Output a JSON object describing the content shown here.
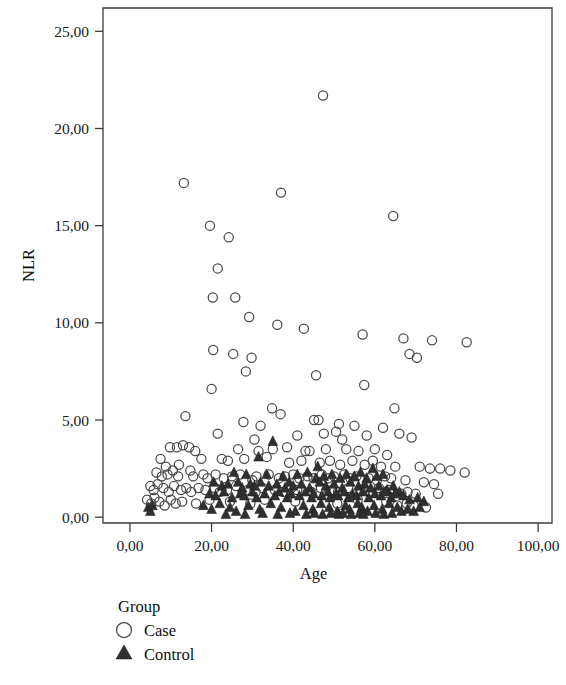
{
  "figure": {
    "background": "#ffffff",
    "plot_area": {
      "left": 103,
      "top": 8,
      "right": 552,
      "bottom": 523
    }
  },
  "axes": {
    "x": {
      "title": "Age",
      "ticks": [
        "0,00",
        "20,00",
        "40,00",
        "60,00",
        "80,00",
        "100,00"
      ],
      "tick_values": [
        0,
        20,
        40,
        60,
        80,
        100
      ],
      "min": -6.6,
      "max": 103.4
    },
    "y": {
      "title": "NLR",
      "ticks": [
        "0,00",
        "5,00",
        "10,00",
        "15,00",
        "20,00",
        "25,00"
      ],
      "tick_values": [
        0,
        5,
        10,
        15,
        20,
        25
      ],
      "min": -0.3,
      "max": 26.2
    }
  },
  "legend": {
    "title": "Group",
    "items": [
      {
        "label": "Case",
        "marker": "open-circle",
        "color": "#4a4a4a"
      },
      {
        "label": "Control",
        "marker": "filled-triangle",
        "color": "#303030"
      }
    ]
  },
  "chart_data": {
    "type": "scatter",
    "title": "",
    "xlabel": "Age",
    "ylabel": "NLR",
    "xlim": [
      -6.6,
      103.4
    ],
    "ylim": [
      -0.3,
      26.2
    ],
    "xticks": [
      0,
      20,
      40,
      60,
      80,
      100
    ],
    "yticks": [
      0,
      5,
      10,
      15,
      20,
      25
    ],
    "grid": false,
    "legend_position": "below-left",
    "series": [
      {
        "name": "Case",
        "marker": "open-circle",
        "color": "#4a4a4a",
        "points": [
          [
            47.3,
            21.7
          ],
          [
            13.2,
            17.2
          ],
          [
            37.0,
            16.7
          ],
          [
            64.5,
            15.5
          ],
          [
            19.6,
            15.0
          ],
          [
            24.2,
            14.4
          ],
          [
            21.5,
            12.8
          ],
          [
            20.3,
            11.3
          ],
          [
            25.8,
            11.3
          ],
          [
            29.2,
            10.3
          ],
          [
            36.1,
            9.9
          ],
          [
            42.6,
            9.7
          ],
          [
            57.0,
            9.4
          ],
          [
            67.0,
            9.2
          ],
          [
            74.0,
            9.1
          ],
          [
            82.5,
            9.0
          ],
          [
            20.4,
            8.6
          ],
          [
            25.3,
            8.4
          ],
          [
            29.8,
            8.2
          ],
          [
            70.3,
            8.2
          ],
          [
            68.5,
            8.4
          ],
          [
            28.4,
            7.5
          ],
          [
            45.6,
            7.3
          ],
          [
            57.4,
            6.8
          ],
          [
            20.0,
            6.6
          ],
          [
            34.8,
            5.6
          ],
          [
            36.9,
            5.3
          ],
          [
            13.6,
            5.2
          ],
          [
            64.8,
            5.6
          ],
          [
            27.8,
            4.9
          ],
          [
            32.0,
            4.7
          ],
          [
            45.1,
            5.0
          ],
          [
            46.2,
            5.0
          ],
          [
            51.2,
            4.8
          ],
          [
            55.0,
            4.7
          ],
          [
            62.0,
            4.6
          ],
          [
            21.5,
            4.3
          ],
          [
            30.5,
            4.0
          ],
          [
            41.0,
            4.2
          ],
          [
            47.5,
            4.3
          ],
          [
            50.5,
            4.4
          ],
          [
            52.0,
            4.0
          ],
          [
            58.0,
            4.2
          ],
          [
            66.0,
            4.3
          ],
          [
            69.0,
            4.1
          ],
          [
            9.8,
            3.6
          ],
          [
            11.5,
            3.6
          ],
          [
            13.0,
            3.7
          ],
          [
            14.5,
            3.6
          ],
          [
            16.0,
            3.4
          ],
          [
            26.5,
            3.5
          ],
          [
            31.5,
            3.4
          ],
          [
            35.0,
            3.5
          ],
          [
            38.5,
            3.6
          ],
          [
            43.0,
            3.4
          ],
          [
            44.0,
            3.4
          ],
          [
            48.0,
            3.5
          ],
          [
            53.0,
            3.5
          ],
          [
            56.0,
            3.4
          ],
          [
            60.0,
            3.5
          ],
          [
            63.0,
            3.2
          ],
          [
            7.5,
            3.0
          ],
          [
            8.8,
            2.6
          ],
          [
            12.0,
            2.7
          ],
          [
            17.5,
            3.0
          ],
          [
            22.5,
            3.0
          ],
          [
            24.0,
            2.9
          ],
          [
            28.0,
            3.0
          ],
          [
            33.5,
            3.1
          ],
          [
            39.0,
            2.8
          ],
          [
            42.0,
            2.9
          ],
          [
            46.5,
            2.8
          ],
          [
            49.0,
            2.9
          ],
          [
            51.5,
            2.7
          ],
          [
            54.5,
            2.9
          ],
          [
            57.5,
            2.7
          ],
          [
            59.5,
            2.9
          ],
          [
            61.5,
            2.6
          ],
          [
            65.0,
            2.6
          ],
          [
            71.0,
            2.6
          ],
          [
            73.5,
            2.5
          ],
          [
            76.0,
            2.5
          ],
          [
            78.5,
            2.4
          ],
          [
            82.0,
            2.3
          ],
          [
            6.5,
            2.3
          ],
          [
            7.8,
            2.1
          ],
          [
            9.2,
            2.2
          ],
          [
            10.5,
            2.4
          ],
          [
            11.8,
            2.1
          ],
          [
            14.8,
            2.4
          ],
          [
            15.5,
            2.1
          ],
          [
            18.0,
            2.2
          ],
          [
            19.0,
            2.0
          ],
          [
            21.0,
            2.2
          ],
          [
            23.0,
            2.0
          ],
          [
            25.0,
            2.1
          ],
          [
            27.0,
            2.2
          ],
          [
            30.0,
            1.9
          ],
          [
            31.0,
            2.1
          ],
          [
            34.0,
            2.2
          ],
          [
            36.5,
            2.0
          ],
          [
            38.0,
            2.1
          ],
          [
            40.0,
            2.2
          ],
          [
            41.5,
            2.0
          ],
          [
            43.5,
            2.1
          ],
          [
            45.0,
            2.0
          ],
          [
            47.0,
            2.2
          ],
          [
            48.5,
            2.0
          ],
          [
            50.0,
            2.1
          ],
          [
            52.5,
            2.2
          ],
          [
            54.0,
            2.0
          ],
          [
            55.5,
            2.1
          ],
          [
            58.5,
            2.0
          ],
          [
            60.5,
            1.9
          ],
          [
            62.5,
            2.1
          ],
          [
            64.0,
            2.0
          ],
          [
            67.5,
            1.9
          ],
          [
            72.0,
            1.8
          ],
          [
            74.5,
            1.7
          ],
          [
            5.0,
            1.6
          ],
          [
            5.8,
            1.4
          ],
          [
            6.8,
            1.7
          ],
          [
            8.2,
            1.5
          ],
          [
            9.5,
            1.3
          ],
          [
            10.8,
            1.6
          ],
          [
            12.5,
            1.4
          ],
          [
            13.8,
            1.5
          ],
          [
            15.0,
            1.3
          ],
          [
            16.8,
            1.5
          ],
          [
            18.5,
            1.4
          ],
          [
            20.8,
            1.5
          ],
          [
            22.0,
            1.3
          ],
          [
            23.8,
            1.4
          ],
          [
            26.0,
            1.6
          ],
          [
            28.8,
            1.4
          ],
          [
            30.8,
            1.3
          ],
          [
            32.5,
            1.5
          ],
          [
            35.5,
            1.4
          ],
          [
            37.5,
            1.3
          ],
          [
            39.5,
            1.5
          ],
          [
            41.0,
            1.4
          ],
          [
            44.5,
            1.3
          ],
          [
            46.8,
            1.5
          ],
          [
            49.5,
            1.4
          ],
          [
            51.0,
            1.3
          ],
          [
            53.5,
            1.5
          ],
          [
            56.5,
            1.4
          ],
          [
            59.0,
            1.3
          ],
          [
            61.0,
            1.5
          ],
          [
            63.5,
            1.4
          ],
          [
            66.5,
            1.2
          ],
          [
            68.0,
            1.3
          ],
          [
            70.0,
            1.2
          ],
          [
            75.5,
            1.2
          ],
          [
            4.2,
            0.9
          ],
          [
            5.2,
            0.7
          ],
          [
            6.0,
            1.0
          ],
          [
            7.2,
            0.8
          ],
          [
            8.5,
            0.6
          ],
          [
            10.0,
            0.9
          ],
          [
            11.2,
            0.7
          ],
          [
            12.8,
            0.8
          ],
          [
            16.2,
            0.7
          ],
          [
            19.5,
            0.9
          ],
          [
            24.5,
            0.8
          ],
          [
            29.5,
            0.7
          ],
          [
            33.0,
            0.9
          ],
          [
            40.5,
            0.8
          ],
          [
            50.8,
            0.7
          ],
          [
            55.8,
            0.9
          ],
          [
            62.8,
            0.8
          ],
          [
            65.5,
            0.6
          ],
          [
            67.8,
            0.7
          ],
          [
            69.5,
            0.6
          ],
          [
            72.5,
            0.5
          ]
        ]
      },
      {
        "name": "Control",
        "marker": "filled-triangle",
        "color": "#303030",
        "points": [
          [
            35.0,
            3.9
          ],
          [
            31.5,
            3.1
          ],
          [
            46.0,
            2.6
          ],
          [
            59.5,
            2.5
          ],
          [
            62.0,
            2.2
          ],
          [
            25.5,
            2.3
          ],
          [
            28.5,
            2.2
          ],
          [
            33.5,
            2.2
          ],
          [
            37.5,
            2.1
          ],
          [
            41.0,
            2.2
          ],
          [
            43.5,
            2.3
          ],
          [
            45.5,
            2.0
          ],
          [
            47.5,
            2.1
          ],
          [
            49.5,
            2.2
          ],
          [
            51.5,
            2.0
          ],
          [
            53.0,
            2.2
          ],
          [
            55.0,
            2.1
          ],
          [
            56.5,
            2.3
          ],
          [
            58.0,
            2.0
          ],
          [
            60.5,
            2.1
          ],
          [
            20.5,
            1.8
          ],
          [
            22.5,
            1.6
          ],
          [
            24.0,
            1.7
          ],
          [
            26.5,
            1.8
          ],
          [
            27.5,
            1.5
          ],
          [
            29.5,
            1.7
          ],
          [
            30.5,
            1.6
          ],
          [
            32.0,
            1.8
          ],
          [
            34.0,
            1.6
          ],
          [
            36.0,
            1.7
          ],
          [
            38.0,
            1.5
          ],
          [
            39.0,
            1.8
          ],
          [
            40.0,
            1.6
          ],
          [
            42.0,
            1.7
          ],
          [
            44.0,
            1.5
          ],
          [
            46.5,
            1.8
          ],
          [
            48.0,
            1.6
          ],
          [
            50.0,
            1.7
          ],
          [
            52.0,
            1.5
          ],
          [
            54.0,
            1.8
          ],
          [
            56.0,
            1.6
          ],
          [
            57.5,
            1.7
          ],
          [
            59.0,
            1.5
          ],
          [
            61.0,
            1.6
          ],
          [
            63.0,
            1.4
          ],
          [
            64.5,
            1.6
          ],
          [
            66.0,
            1.3
          ],
          [
            19.5,
            1.2
          ],
          [
            21.0,
            1.1
          ],
          [
            23.0,
            1.3
          ],
          [
            25.0,
            1.0
          ],
          [
            27.0,
            1.2
          ],
          [
            28.0,
            1.1
          ],
          [
            30.0,
            1.3
          ],
          [
            31.0,
            1.0
          ],
          [
            33.0,
            1.2
          ],
          [
            35.5,
            1.1
          ],
          [
            36.5,
            1.3
          ],
          [
            38.5,
            1.0
          ],
          [
            39.5,
            1.2
          ],
          [
            41.5,
            1.1
          ],
          [
            43.0,
            1.3
          ],
          [
            44.5,
            1.0
          ],
          [
            45.0,
            1.2
          ],
          [
            47.0,
            1.1
          ],
          [
            48.5,
            1.3
          ],
          [
            49.0,
            1.0
          ],
          [
            50.5,
            1.2
          ],
          [
            51.0,
            1.1
          ],
          [
            52.5,
            1.3
          ],
          [
            53.5,
            1.0
          ],
          [
            54.5,
            1.2
          ],
          [
            55.5,
            1.1
          ],
          [
            57.0,
            1.3
          ],
          [
            58.5,
            1.0
          ],
          [
            60.0,
            1.2
          ],
          [
            61.5,
            1.1
          ],
          [
            62.5,
            1.3
          ],
          [
            64.0,
            1.0
          ],
          [
            65.0,
            1.2
          ],
          [
            67.0,
            1.1
          ],
          [
            68.5,
            0.9
          ],
          [
            70.5,
            1.0
          ],
          [
            72.0,
            0.8
          ],
          [
            4.5,
            0.5
          ],
          [
            5.0,
            0.3
          ],
          [
            5.5,
            0.6
          ],
          [
            18.0,
            0.6
          ],
          [
            20.0,
            0.4
          ],
          [
            22.0,
            0.7
          ],
          [
            24.5,
            0.5
          ],
          [
            26.0,
            0.3
          ],
          [
            29.0,
            0.6
          ],
          [
            31.8,
            0.4
          ],
          [
            34.5,
            0.7
          ],
          [
            37.0,
            0.5
          ],
          [
            40.5,
            0.3
          ],
          [
            42.5,
            0.6
          ],
          [
            44.8,
            0.4
          ],
          [
            46.8,
            0.7
          ],
          [
            48.8,
            0.5
          ],
          [
            50.8,
            0.3
          ],
          [
            52.8,
            0.6
          ],
          [
            53.8,
            0.4
          ],
          [
            55.8,
            0.7
          ],
          [
            56.8,
            0.5
          ],
          [
            58.2,
            0.3
          ],
          [
            59.8,
            0.6
          ],
          [
            61.8,
            0.4
          ],
          [
            63.5,
            0.7
          ],
          [
            65.5,
            0.5
          ],
          [
            66.5,
            0.3
          ],
          [
            68.0,
            0.4
          ],
          [
            69.5,
            0.3
          ],
          [
            71.0,
            0.5
          ],
          [
            23.5,
            0.15
          ],
          [
            28.2,
            0.15
          ],
          [
            32.5,
            0.2
          ],
          [
            36.2,
            0.15
          ],
          [
            39.2,
            0.2
          ],
          [
            43.2,
            0.15
          ],
          [
            45.2,
            0.2
          ],
          [
            47.2,
            0.15
          ],
          [
            49.2,
            0.2
          ],
          [
            51.2,
            0.15
          ],
          [
            52.2,
            0.2
          ],
          [
            54.2,
            0.15
          ],
          [
            56.2,
            0.2
          ],
          [
            57.2,
            0.15
          ],
          [
            60.2,
            0.2
          ],
          [
            62.2,
            0.15
          ],
          [
            64.2,
            0.2
          ]
        ]
      }
    ]
  }
}
